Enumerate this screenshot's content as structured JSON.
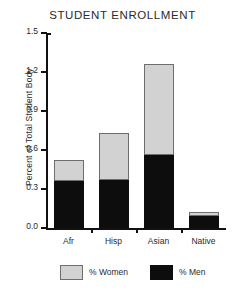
{
  "chart_data": {
    "type": "bar",
    "subtype": "stacked",
    "title": "STUDENT ENROLLMENT",
    "xlabel": "",
    "ylabel": "Percent of Total Student Body",
    "categories": [
      "Afr",
      "Hisp",
      "Asian",
      "Native"
    ],
    "series": [
      {
        "name": "% Men",
        "color": "#0d0d0d",
        "values": [
          0.36,
          0.37,
          0.56,
          0.09
        ]
      },
      {
        "name": "% Women",
        "color": "#d2d2d2",
        "values": [
          0.16,
          0.36,
          0.7,
          0.03
        ]
      }
    ],
    "totals": [
      0.52,
      0.73,
      1.26,
      0.12
    ],
    "ylim": [
      0.0,
      1.5
    ],
    "yticks": [
      "0.0",
      "0.3",
      "0.6",
      "0.9",
      "1.2",
      "1.5"
    ],
    "ytick_values": [
      0.0,
      0.3,
      0.6,
      0.9,
      1.2,
      1.5
    ],
    "grid": false,
    "legend_position": "bottom"
  },
  "legend": {
    "women_label": "% Women",
    "men_label": "% Men"
  }
}
